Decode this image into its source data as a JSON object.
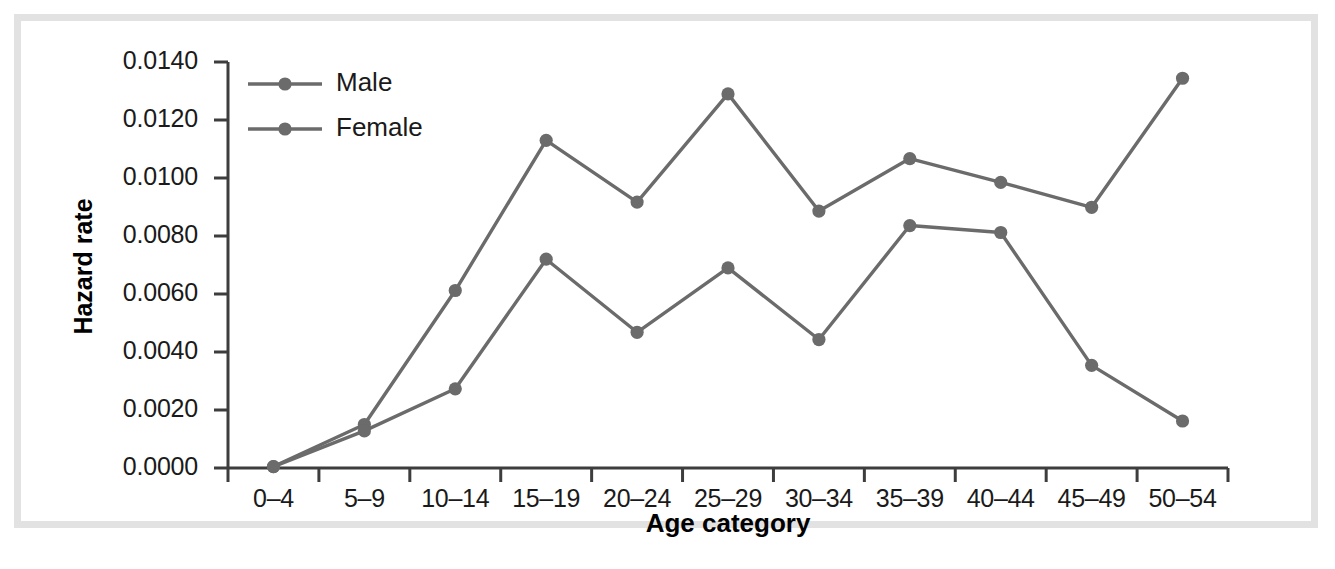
{
  "chart_data": {
    "type": "line",
    "title": "",
    "xlabel": "Age category",
    "ylabel": "Hazard rate",
    "categories": [
      "0–4",
      "5–9",
      "10–14",
      "15–19",
      "20–24",
      "25–29",
      "30–34",
      "35–39",
      "40–44",
      "45–49",
      "50–54"
    ],
    "series": [
      {
        "name": "Male",
        "color": "#6b6b6b",
        "values": [
          5e-05,
          0.0015,
          0.00612,
          0.0113,
          0.00917,
          0.0129,
          0.00886,
          0.01067,
          0.00985,
          0.00899,
          0.01344
        ]
      },
      {
        "name": "Female",
        "color": "#6b6b6b",
        "values": [
          5e-05,
          0.00128,
          0.00273,
          0.0072,
          0.00468,
          0.0069,
          0.00443,
          0.00836,
          0.00812,
          0.00354,
          0.00162
        ]
      }
    ],
    "ylim": [
      0.0,
      0.014
    ],
    "ytick_labels": [
      "0.0000",
      "0.0020",
      "0.0040",
      "0.0060",
      "0.0080",
      "0.0100",
      "0.0120",
      "0.0140"
    ],
    "ytick_values": [
      0.0,
      0.002,
      0.004,
      0.006,
      0.008,
      0.01,
      0.012,
      0.014
    ],
    "grid": false,
    "legend_position": "top-left-inside",
    "legend_entries": [
      "Male",
      "Female"
    ],
    "frame_color": "#e2e2e2",
    "axis_color": "#3d3d3d",
    "line_color": "#6b6b6b"
  }
}
